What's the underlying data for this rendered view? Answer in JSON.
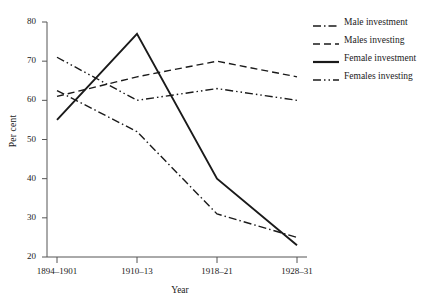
{
  "chart_data": {
    "type": "line",
    "title": "",
    "xlabel": "Year",
    "ylabel": "Per cent",
    "categories": [
      "1894–1901",
      "1910–13",
      "1918–21",
      "1928–31"
    ],
    "ylim": [
      20,
      80
    ],
    "yticks": [
      20,
      30,
      40,
      50,
      60,
      70,
      80
    ],
    "ytick_labels": [
      "20",
      "30",
      "40",
      "50",
      "60",
      "70",
      "80"
    ],
    "grid": false,
    "legend_position": "right",
    "series": [
      {
        "name": "Male investment",
        "style": "dash-dot",
        "color": "#1a1a1a",
        "values": [
          62.5,
          52,
          31,
          25
        ]
      },
      {
        "name": "Males investing",
        "style": "dashed",
        "color": "#1a1a1a",
        "values": [
          61,
          66,
          70,
          66
        ]
      },
      {
        "name": "Female investment",
        "style": "solid",
        "color": "#1a1a1a",
        "values": [
          55,
          77,
          40,
          23
        ]
      },
      {
        "name": "Females investing",
        "style": "dash-dot-dot",
        "color": "#1a1a1a",
        "values": [
          71,
          60,
          63,
          60
        ]
      }
    ]
  }
}
